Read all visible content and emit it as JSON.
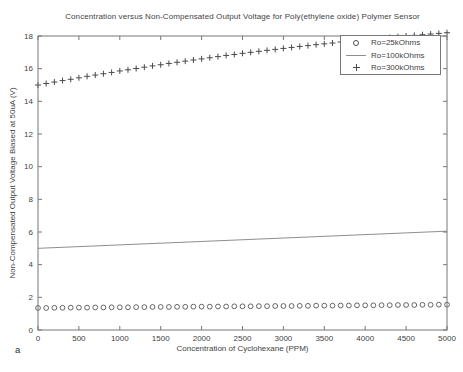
{
  "figure": {
    "subfigure_label": "a"
  },
  "chart_data": {
    "type": "scatter",
    "title": "Concentration versus Non-Compensated Output Voltage for Poly(ethylene oxide) Polymer Sensor",
    "xlabel": "Concentration of Cyclohexane (PPM)",
    "ylabel": "Non-Compensated Output Voltage Biased at 50uA (V)",
    "xlim": [
      0,
      5000
    ],
    "ylim": [
      0,
      18
    ],
    "xticks": [
      0,
      500,
      1000,
      1500,
      2000,
      2500,
      3000,
      3500,
      4000,
      4500,
      5000
    ],
    "yticks": [
      0,
      2,
      4,
      6,
      8,
      10,
      12,
      14,
      16,
      18
    ],
    "grid": false,
    "legend_position": "top-right",
    "colors": {
      "axis": "#777777",
      "text": "#3f3f3f",
      "circle_marker": "#555555",
      "plus_marker": "#4a4a4a",
      "line_series": "#8e8e8e",
      "background": "#ffffff"
    },
    "series": [
      {
        "name": "Ro=25kOhms",
        "marker": "circle",
        "x": [
          0,
          100,
          200,
          300,
          400,
          500,
          600,
          700,
          800,
          900,
          1000,
          1100,
          1200,
          1300,
          1400,
          1500,
          1600,
          1700,
          1800,
          1900,
          2000,
          2100,
          2200,
          2300,
          2400,
          2500,
          2600,
          2700,
          2800,
          2900,
          3000,
          3100,
          3200,
          3300,
          3400,
          3500,
          3600,
          3700,
          3800,
          3900,
          4000,
          4100,
          4200,
          4300,
          4400,
          4500,
          4600,
          4700,
          4800,
          4900,
          5000
        ],
        "y": [
          1.35,
          1.35,
          1.36,
          1.36,
          1.37,
          1.37,
          1.37,
          1.38,
          1.38,
          1.39,
          1.39,
          1.39,
          1.4,
          1.4,
          1.41,
          1.41,
          1.41,
          1.42,
          1.42,
          1.43,
          1.43,
          1.43,
          1.44,
          1.44,
          1.45,
          1.45,
          1.45,
          1.46,
          1.46,
          1.47,
          1.47,
          1.47,
          1.48,
          1.48,
          1.49,
          1.49,
          1.49,
          1.5,
          1.5,
          1.51,
          1.51,
          1.51,
          1.52,
          1.52,
          1.53,
          1.53,
          1.53,
          1.54,
          1.54,
          1.55,
          1.55
        ]
      },
      {
        "name": "Ro=100kOhms",
        "marker": "line",
        "x": [
          0,
          5000
        ],
        "y": [
          5.0,
          6.05
        ]
      },
      {
        "name": "Ro=300kOhms",
        "marker": "plus",
        "x": [
          0,
          100,
          200,
          300,
          400,
          500,
          600,
          700,
          800,
          900,
          1000,
          1100,
          1200,
          1300,
          1400,
          1500,
          1600,
          1700,
          1800,
          1900,
          2000,
          2100,
          2200,
          2300,
          2400,
          2500,
          2600,
          2700,
          2800,
          2900,
          3000,
          3100,
          3200,
          3300,
          3400,
          3500,
          3600,
          3700,
          3800,
          3900,
          4000,
          4100,
          4200,
          4300,
          4400,
          4500,
          4600,
          4700,
          4800,
          4900,
          5000
        ],
        "y": [
          15.0,
          15.09,
          15.18,
          15.27,
          15.35,
          15.44,
          15.53,
          15.61,
          15.69,
          15.77,
          15.86,
          15.93,
          16.01,
          16.09,
          16.17,
          16.24,
          16.32,
          16.39,
          16.46,
          16.53,
          16.6,
          16.67,
          16.74,
          16.81,
          16.87,
          16.94,
          17.0,
          17.06,
          17.12,
          17.18,
          17.24,
          17.3,
          17.36,
          17.41,
          17.47,
          17.52,
          17.57,
          17.63,
          17.68,
          17.73,
          17.77,
          17.82,
          17.87,
          17.91,
          17.96,
          18.0,
          18.04,
          18.08,
          18.12,
          18.16,
          18.2
        ]
      }
    ]
  }
}
